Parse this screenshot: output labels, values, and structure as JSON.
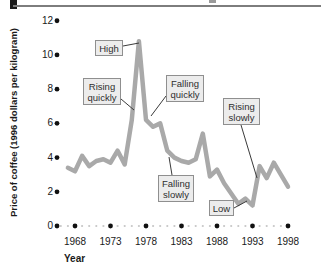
{
  "figure": {
    "corner_tab_color": "#1c1c1c",
    "rule_color": "#7d7d7d"
  },
  "chart_data": {
    "type": "line",
    "title": "",
    "xlabel": "Year",
    "ylabel": "Price of coffee (1996 dollars per kilogram)",
    "x_ticks": [
      1968,
      1973,
      1978,
      1983,
      1988,
      1993,
      1998
    ],
    "y_ticks": [
      0,
      2,
      4,
      6,
      8,
      10,
      12
    ],
    "xlim": [
      1966,
      1999
    ],
    "ylim": [
      0,
      12
    ],
    "grid": false,
    "legend": false,
    "line_color": "#a9a9a9",
    "tick_dot_color": "#111111",
    "minor_dot_color": "#c6c6c6",
    "connector_color": "#3a3a3a",
    "annotation_box_fill": "#ececec",
    "annotation_box_border": "#8f8f8f",
    "series": [
      {
        "name": "Price of coffee",
        "x": [
          1967,
          1968,
          1969,
          1970,
          1971,
          1972,
          1973,
          1974,
          1975,
          1976,
          1977,
          1978,
          1979,
          1980,
          1981,
          1982,
          1983,
          1984,
          1985,
          1986,
          1987,
          1988,
          1989,
          1990,
          1991,
          1992,
          1993,
          1994,
          1995,
          1996,
          1997,
          1998
        ],
        "y": [
          3.4,
          3.2,
          4.1,
          3.5,
          3.8,
          3.9,
          3.7,
          4.4,
          3.6,
          6.2,
          10.8,
          6.2,
          5.8,
          6.0,
          4.4,
          4.0,
          3.8,
          3.7,
          3.9,
          5.4,
          2.9,
          3.3,
          2.5,
          1.9,
          1.3,
          1.6,
          1.2,
          3.5,
          2.8,
          3.7,
          3.0,
          2.3
        ]
      }
    ],
    "annotations": [
      {
        "id": "high",
        "label": "High",
        "box": {
          "x": 95,
          "y": 40,
          "w": 28,
          "h": 16
        },
        "line": {
          "x1": 123,
          "y1": 46,
          "x2": 139,
          "y2": 43
        }
      },
      {
        "id": "rising-quickly",
        "label": "Rising\nquickly",
        "box": {
          "x": 83,
          "y": 78,
          "w": 38,
          "h": 27
        },
        "line": {
          "x1": 121,
          "y1": 99,
          "x2": 134,
          "y2": 110
        }
      },
      {
        "id": "falling-quickly",
        "label": "Falling\nquickly",
        "box": {
          "x": 166,
          "y": 75,
          "w": 38,
          "h": 27
        },
        "line": {
          "x1": 166,
          "y1": 96,
          "x2": 151,
          "y2": 116
        }
      },
      {
        "id": "falling-slowly",
        "label": "Falling\nslowly",
        "box": {
          "x": 158,
          "y": 175,
          "w": 36,
          "h": 27
        },
        "line": {
          "x1": 172,
          "y1": 175,
          "x2": 169,
          "y2": 157
        }
      },
      {
        "id": "rising-slowly",
        "label": "Rising\nslowly",
        "box": {
          "x": 223,
          "y": 98,
          "w": 37,
          "h": 27
        },
        "line": {
          "x1": 241,
          "y1": 125,
          "x2": 257,
          "y2": 178
        }
      },
      {
        "id": "low",
        "label": "Low",
        "box": {
          "x": 209,
          "y": 200,
          "w": 25,
          "h": 16
        },
        "line": {
          "x1": 234,
          "y1": 208,
          "x2": 247,
          "y2": 201
        }
      }
    ]
  }
}
